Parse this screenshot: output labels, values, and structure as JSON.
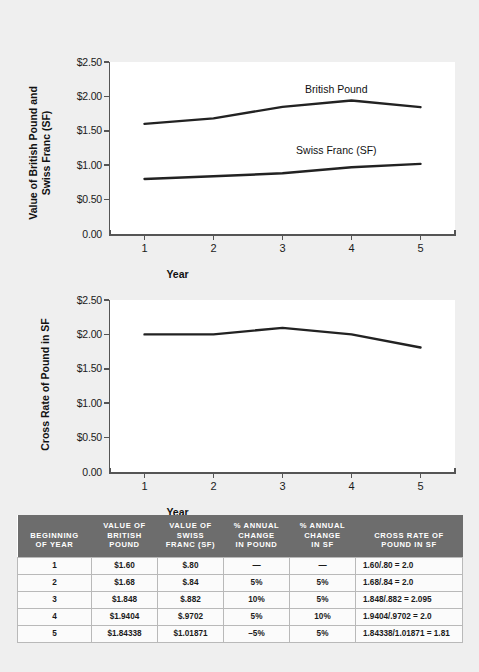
{
  "chart_data": [
    {
      "type": "line",
      "id": "chart-values",
      "title": "",
      "xlabel": "Year",
      "ylabel": "Value of British Pound and\nSwiss Franc (SF)",
      "x": [
        1,
        2,
        3,
        4,
        5
      ],
      "xticklabels": [
        "1",
        "2",
        "3",
        "4",
        "5"
      ],
      "yticklabels": [
        "$2.50",
        "$2.00",
        "$1.50",
        "$1.00",
        "$0.50",
        "0.00"
      ],
      "ytickvalues": [
        2.5,
        2.0,
        1.5,
        1.0,
        0.5,
        0.0
      ],
      "ylim": [
        0,
        2.5
      ],
      "xlim": [
        0.5,
        5.5
      ],
      "grid": false,
      "legend_position": "inline-annotation",
      "series": [
        {
          "name": "British Pound",
          "values": [
            1.6,
            1.68,
            1.848,
            1.9404,
            1.84338
          ],
          "label_x": 3.78,
          "label_y": 2.1
        },
        {
          "name": "Swiss Franc (SF)",
          "values": [
            0.8,
            0.84,
            0.882,
            0.9702,
            1.01871
          ],
          "label_x": 3.78,
          "label_y": 1.21
        }
      ]
    },
    {
      "type": "line",
      "id": "chart-cross-rate",
      "title": "",
      "xlabel": "Year",
      "ylabel": "Cross Rate of Pound in SF",
      "x": [
        1,
        2,
        3,
        4,
        5
      ],
      "xticklabels": [
        "1",
        "2",
        "3",
        "4",
        "5"
      ],
      "yticklabels": [
        "$2.50",
        "$2.00",
        "$1.50",
        "$1.00",
        "$0.50",
        "0.00"
      ],
      "ytickvalues": [
        2.5,
        2.0,
        1.5,
        1.0,
        0.5,
        0.0
      ],
      "ylim": [
        0,
        2.5
      ],
      "xlim": [
        0.5,
        5.5
      ],
      "grid": false,
      "legend_position": "none",
      "series": [
        {
          "name": "Cross Rate of Pound in SF",
          "values": [
            2.0,
            2.0,
            2.095,
            2.0,
            1.81
          ]
        }
      ]
    }
  ],
  "table": {
    "headers": [
      "BEGINNING\nOF YEAR",
      "VALUE OF\nBRITISH\nPOUND",
      "VALUE OF\nSWISS\nFRANC (SF)",
      "% ANNUAL\nCHANGE\nIN POUND",
      "% ANNUAL\nCHANGE\nIN SF",
      "CROSS RATE OF\nPOUND IN SF"
    ],
    "rows": [
      [
        "1",
        "$1.60",
        "$.80",
        "—",
        "—",
        "1.60/.80 = 2.0"
      ],
      [
        "2",
        "$1.68",
        "$.84",
        "5%",
        "5%",
        "1.68/.84 = 2.0"
      ],
      [
        "3",
        "$1.848",
        "$.882",
        "10%",
        "5%",
        "1.848/.882 = 2.095"
      ],
      [
        "4",
        "$1.9404",
        "$.9702",
        "5%",
        "10%",
        "1.9404/.9702 = 2.0"
      ],
      [
        "5",
        "$1.84338",
        "$1.01871",
        "–5%",
        "5%",
        "1.84338/1.01871 = 1.81"
      ]
    ]
  },
  "colors": {
    "page_background": "#efefef",
    "plot_background": "#ffffff",
    "line": "#222222",
    "axis": "#555555",
    "table_header_bg": "#6d6d6d",
    "table_header_fg": "#ffffff",
    "table_cell_bg": "#fbfbfb",
    "table_border": "#b9b9b9"
  }
}
